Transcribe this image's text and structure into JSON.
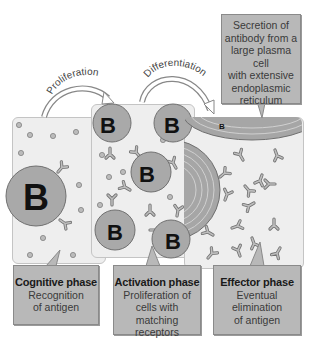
{
  "diagram": {
    "type": "immune-response-phases",
    "arrows": [
      {
        "label": "Proliferation",
        "from": "cognitive-panel",
        "to": "activation-panel"
      },
      {
        "label": "Differentiation",
        "from": "activation-panel",
        "to": "effector-panel"
      }
    ],
    "top_callout": {
      "text": "Secretion of\nantibody from a\nlarge plasma cell\nwith extensive\nendoplasmic\nreticulum"
    },
    "cell_label": "B",
    "phases": [
      {
        "title": "Cognitive phase",
        "description": "Recognition\nof antigen"
      },
      {
        "title": "Activation phase",
        "description": "Proliferation of\ncells with matching\nreceptors"
      },
      {
        "title": "Effector phase",
        "description": "Eventual\nelimination\nof antigen"
      }
    ]
  },
  "colors": {
    "panel_bg": "#eeeeee",
    "cell_fill": "#a9a9a9",
    "callout_bg": "#b8b8b8",
    "outline": "#6f6f6f"
  }
}
